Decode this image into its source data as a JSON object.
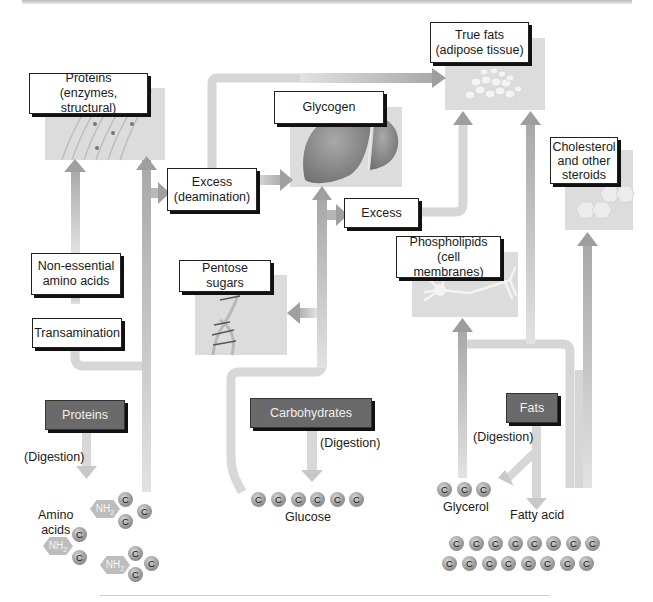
{
  "header": {
    "clipped_caption": ""
  },
  "boxes": {
    "proteins_structural": {
      "line1": "Proteins",
      "line2": "(enzymes, structural)"
    },
    "glycogen": {
      "label": "Glycogen"
    },
    "true_fats": {
      "line1": "True fats",
      "line2": "(adipose tissue)"
    },
    "cholesterol": {
      "line1": "Cholesterol",
      "line2": "and other",
      "line3": "steroids"
    },
    "excess_deamination": {
      "line1": "Excess",
      "line2": "(deamination)"
    },
    "excess": {
      "label": "Excess"
    },
    "non_essential": {
      "line1": "Non-essential",
      "line2": "amino acids"
    },
    "transamination": {
      "label": "Transamination"
    },
    "pentose_sugars": {
      "label": "Pentose sugars"
    },
    "phospholipids": {
      "line1": "Phospholipids",
      "line2": "(cell membranes)"
    }
  },
  "sources": {
    "proteins": {
      "label": "Proteins",
      "digestion": "(Digestion)"
    },
    "carbohydrates": {
      "label": "Carbohydrates",
      "digestion": "(Digestion)"
    },
    "fats": {
      "label": "Fats",
      "digestion": "(Digestion)"
    }
  },
  "products": {
    "amino_acids": {
      "line1": "Amino",
      "line2": "acids",
      "group_label": "NH2",
      "atom": "C"
    },
    "glucose": {
      "label": "Glucose",
      "atom": "C",
      "count": 6
    },
    "glycerol": {
      "label": "Glycerol",
      "atom": "C",
      "count": 3
    },
    "fatty_acid": {
      "label": "Fatty acid",
      "atom": "C",
      "row1_count": 8,
      "row2_count": 8
    }
  },
  "colors": {
    "pipe": "#d6d6d6",
    "dark_box": "#6a6a6a",
    "image_panel": "#dcdcdc",
    "liver": "#8c8c8c"
  }
}
